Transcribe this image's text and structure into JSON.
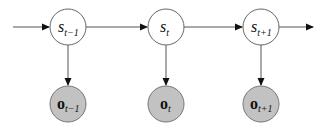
{
  "diagram": {
    "type": "hidden-markov-model",
    "colors": {
      "edge": "#555555",
      "state_fill": "#ffffff",
      "state_stroke": "#666666",
      "observation_fill": "#c2c2c2",
      "observation_stroke": "#777777"
    },
    "states": [
      {
        "id": "s_prev",
        "base": "s",
        "sub": "t−1",
        "cx": 68,
        "cy": 27
      },
      {
        "id": "s_cur",
        "base": "s",
        "sub": "t",
        "cx": 166,
        "cy": 27
      },
      {
        "id": "s_next",
        "base": "s",
        "sub": "t+1",
        "cx": 261,
        "cy": 27
      }
    ],
    "observations": [
      {
        "id": "o_prev",
        "base": "o",
        "sub": "t−1",
        "cx": 68,
        "cy": 104
      },
      {
        "id": "o_cur",
        "base": "o",
        "sub": "t",
        "cx": 166,
        "cy": 104
      },
      {
        "id": "o_next",
        "base": "o",
        "sub": "t+1",
        "cx": 261,
        "cy": 104
      }
    ],
    "edges": [
      {
        "from": "in",
        "to": "s_prev"
      },
      {
        "from": "s_prev",
        "to": "s_cur"
      },
      {
        "from": "s_cur",
        "to": "s_next"
      },
      {
        "from": "s_next",
        "to": "out"
      },
      {
        "from": "s_prev",
        "to": "o_prev"
      },
      {
        "from": "s_cur",
        "to": "o_cur"
      },
      {
        "from": "s_next",
        "to": "o_next"
      }
    ]
  }
}
